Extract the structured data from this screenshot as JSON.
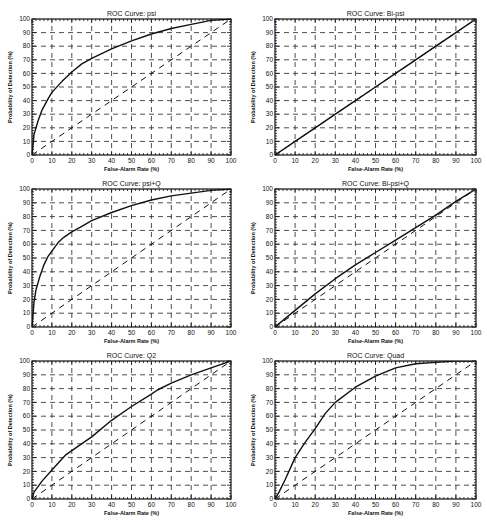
{
  "chart_data": [
    {
      "type": "line",
      "title": "ROC Curve:  psi",
      "xlabel": "False-Alarm Rate (%)",
      "ylabel": "Probability of Detection (%)",
      "xlim": [
        0,
        100
      ],
      "ylim": [
        0,
        100
      ],
      "xticks": [
        0,
        10,
        20,
        30,
        40,
        50,
        60,
        70,
        80,
        90,
        100
      ],
      "yticks": [
        0,
        10,
        20,
        30,
        40,
        50,
        60,
        70,
        80,
        90,
        100
      ],
      "grid": "dashed crosses",
      "series": [
        {
          "name": "ROC",
          "style": "solid",
          "x": [
            0,
            1,
            3,
            5,
            8,
            10,
            15,
            20,
            25,
            30,
            40,
            50,
            60,
            70,
            80,
            90,
            100
          ],
          "y": [
            0,
            15,
            25,
            33,
            41,
            46,
            54,
            61,
            67,
            71,
            78,
            84,
            89,
            93,
            96,
            99,
            100
          ]
        },
        {
          "name": "chance",
          "style": "dashed",
          "x": [
            0,
            100
          ],
          "y": [
            0,
            100
          ]
        }
      ]
    },
    {
      "type": "line",
      "title": "ROC Curve:  Bi-psi",
      "xlabel": "False-Alarm Rate (%)",
      "ylabel": "Probability of Detection (%)",
      "xlim": [
        0,
        100
      ],
      "ylim": [
        0,
        100
      ],
      "xticks": [
        0,
        10,
        20,
        30,
        40,
        50,
        60,
        70,
        80,
        90,
        100
      ],
      "yticks": [
        0,
        10,
        20,
        30,
        40,
        50,
        60,
        70,
        80,
        90,
        100
      ],
      "grid": "dashed crosses",
      "series": [
        {
          "name": "ROC",
          "style": "solid",
          "x": [
            0,
            10,
            20,
            30,
            40,
            50,
            60,
            70,
            80,
            90,
            100
          ],
          "y": [
            0,
            10,
            20,
            30,
            40,
            50,
            60,
            70,
            80,
            90,
            100
          ]
        },
        {
          "name": "chance",
          "style": "dashed",
          "x": [
            0,
            100
          ],
          "y": [
            0,
            100
          ]
        }
      ]
    },
    {
      "type": "line",
      "title": "ROC Curve:  psi+Q",
      "xlabel": "False-Alarm Rate (%)",
      "ylabel": "Probability of Detection (%)",
      "xlim": [
        0,
        100
      ],
      "ylim": [
        0,
        100
      ],
      "xticks": [
        0,
        10,
        20,
        30,
        40,
        50,
        60,
        70,
        80,
        90,
        100
      ],
      "yticks": [
        0,
        10,
        20,
        30,
        40,
        50,
        60,
        70,
        80,
        90,
        100
      ],
      "grid": "dashed crosses",
      "series": [
        {
          "name": "ROC",
          "style": "solid",
          "x": [
            0,
            1,
            2,
            4,
            6,
            8,
            10,
            13,
            16,
            20,
            25,
            30,
            40,
            50,
            60,
            70,
            80,
            90,
            100
          ],
          "y": [
            0,
            18,
            27,
            37,
            45,
            51,
            55,
            61,
            65,
            69,
            73,
            77,
            83,
            88,
            92,
            95,
            97,
            99,
            100
          ]
        },
        {
          "name": "chance",
          "style": "dashed",
          "x": [
            0,
            100
          ],
          "y": [
            0,
            100
          ]
        }
      ]
    },
    {
      "type": "line",
      "title": "ROC Curve:  Bi-psi+Q",
      "xlabel": "False-Alarm Rate (%)",
      "ylabel": "Probability of Detection (%)",
      "xlim": [
        0,
        100
      ],
      "ylim": [
        0,
        100
      ],
      "xticks": [
        0,
        10,
        20,
        30,
        40,
        50,
        60,
        70,
        80,
        90,
        100
      ],
      "yticks": [
        0,
        10,
        20,
        30,
        40,
        50,
        60,
        70,
        80,
        90,
        100
      ],
      "grid": "dashed crosses",
      "series": [
        {
          "name": "ROC",
          "style": "solid",
          "x": [
            0,
            10,
            20,
            30,
            40,
            50,
            60,
            70,
            80,
            90,
            100
          ],
          "y": [
            0,
            12,
            24,
            35,
            45,
            54,
            63,
            72,
            81,
            91,
            100
          ]
        },
        {
          "name": "chance",
          "style": "dashed",
          "x": [
            0,
            100
          ],
          "y": [
            0,
            100
          ]
        }
      ]
    },
    {
      "type": "line",
      "title": "ROC Curve:  Q2",
      "xlabel": "False-Alarm Rate (%)",
      "ylabel": "Probability of Detection (%)",
      "xlim": [
        0,
        100
      ],
      "ylim": [
        0,
        100
      ],
      "xticks": [
        0,
        10,
        20,
        30,
        40,
        50,
        60,
        70,
        80,
        90,
        100
      ],
      "yticks": [
        0,
        10,
        20,
        30,
        40,
        50,
        60,
        70,
        80,
        90,
        100
      ],
      "grid": "dashed crosses",
      "series": [
        {
          "name": "ROC",
          "style": "solid",
          "x": [
            0,
            1,
            3,
            5,
            10,
            17,
            20,
            30,
            40,
            50,
            60,
            63,
            70,
            80,
            90,
            100
          ],
          "y": [
            0,
            5,
            9,
            13,
            21,
            32,
            35,
            45,
            57,
            67,
            76,
            79,
            84,
            90,
            95,
            100
          ]
        },
        {
          "name": "chance",
          "style": "dashed",
          "x": [
            0,
            100
          ],
          "y": [
            0,
            100
          ]
        }
      ]
    },
    {
      "type": "line",
      "title": "ROC Curve:  Quad",
      "xlabel": "False-Alarm Rate (%)",
      "ylabel": "Probability of Detection (%)",
      "xlim": [
        0,
        100
      ],
      "ylim": [
        0,
        100
      ],
      "xticks": [
        0,
        10,
        20,
        30,
        40,
        50,
        60,
        70,
        80,
        90,
        100
      ],
      "yticks": [
        0,
        10,
        20,
        30,
        40,
        50,
        60,
        70,
        80,
        90,
        100
      ],
      "grid": "dashed crosses",
      "series": [
        {
          "name": "ROC",
          "style": "solid",
          "x": [
            0,
            2,
            5,
            10,
            15,
            20,
            25,
            30,
            40,
            50,
            60,
            70,
            80,
            90,
            100
          ],
          "y": [
            0,
            5,
            14,
            30,
            41,
            51,
            62,
            70,
            81,
            89,
            95,
            98,
            99,
            100,
            100
          ]
        },
        {
          "name": "chance",
          "style": "dashed",
          "x": [
            0,
            100
          ],
          "y": [
            0,
            100
          ]
        }
      ]
    }
  ],
  "panels": [
    {
      "title": "ROC Curve:  psi",
      "xlabel": "False-Alarm Rate (%)",
      "ylabel": "Probability of Detection (%)"
    },
    {
      "title": "ROC Curve:  Bi-psi",
      "xlabel": "False-Alarm Rate (%)",
      "ylabel": "Probability of Detection (%)"
    },
    {
      "title": "ROC Curve:  psi+Q",
      "xlabel": "False-Alarm Rate (%)",
      "ylabel": "Probability of Detection (%)"
    },
    {
      "title": "ROC Curve:  Bi-psi+Q",
      "xlabel": "False-Alarm Rate (%)",
      "ylabel": "Probability of Detection (%)"
    },
    {
      "title": "ROC Curve:  Q2",
      "xlabel": "False-Alarm Rate (%)",
      "ylabel": "Probability of Detection (%)"
    },
    {
      "title": "ROC Curve:  Quad",
      "xlabel": "False-Alarm Rate (%)",
      "ylabel": "Probability of Detection (%)"
    }
  ]
}
